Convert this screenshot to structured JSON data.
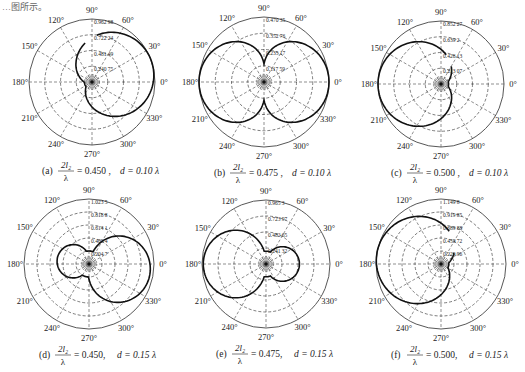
{
  "figure": {
    "header_fragment": "…图所示。",
    "colors": {
      "grid": "#444444",
      "curve": "#111111",
      "text": "#222222",
      "background": "#ffffff"
    }
  },
  "chart_data": [
    {
      "id": "a",
      "type": "polar",
      "label": "(a)",
      "caption": {
        "prefix": "(a)",
        "fraction_num": "2l₂",
        "fraction_den": "λ",
        "eq": "= 0.450 ,",
        "d": "d = 0.10 λ"
      },
      "center": [
        92,
        82
      ],
      "radius": 63,
      "ring_labels": [
        "0.240 75",
        "0.481 49",
        "0.722 24",
        "0.962 98"
      ],
      "rmax": 0.96298,
      "angle_labels": [
        "0°",
        "30°",
        "60°",
        "90°",
        "120°",
        "150°",
        "180°",
        "210°",
        "240°",
        "270°",
        "300°",
        "330°"
      ],
      "pattern": {
        "a": 0.55,
        "b": 0.45,
        "phi": 20,
        "cutout": [
          85,
          100
        ]
      }
    },
    {
      "id": "b",
      "type": "polar",
      "label": "(b)",
      "caption": {
        "prefix": "(b)",
        "fraction_num": "2l₂",
        "fraction_den": "λ",
        "eq": "= 0.475 ,",
        "d": "d = 0.10 λ"
      },
      "center": [
        264,
        82
      ],
      "radius": 65,
      "ring_labels": [
        "0.117 59",
        "0.235 17",
        "0.352 76",
        "0.470 35"
      ],
      "rmax": 0.47035,
      "angle_labels": [
        "0°",
        "30°",
        "60°",
        "90°",
        "120°",
        "150°",
        "180°",
        "210°",
        "240°",
        "270°",
        "300°",
        "330°"
      ],
      "pattern": {
        "type": "figure8"
      }
    },
    {
      "id": "c",
      "type": "polar",
      "label": "(c)",
      "caption": {
        "prefix": "(c)",
        "fraction_num": "2l₂",
        "fraction_den": "λ",
        "eq": "= 0.500 ,",
        "d": "d = 0.10 λ"
      },
      "center": [
        441,
        84
      ],
      "radius": 63,
      "ring_labels": [
        "0.213 07",
        "0.426 13",
        "0.639 2",
        "0.852 27"
      ],
      "rmax": 0.85227,
      "angle_labels": [
        "0°",
        "30°",
        "60°",
        "90°",
        "120°",
        "150°",
        "180°",
        "210°",
        "240°",
        "270°",
        "300°",
        "330°"
      ],
      "pattern": {
        "a": 0.55,
        "b": 0.45,
        "phi": 180,
        "cutout": [
          60,
          80
        ]
      }
    },
    {
      "id": "d",
      "type": "polar",
      "label": "(d)",
      "caption": {
        "prefix": "(d)",
        "fraction_num": "2l₂",
        "fraction_den": "λ",
        "eq": "= 0.450,",
        "d": "d = 0.15 λ"
      },
      "center": [
        89,
        264
      ],
      "radius": 65,
      "ring_labels": [
        "0.204 7",
        "0.409 4",
        "0.614 1",
        "0.818 8",
        "1.023 5"
      ],
      "rmax": 1.0235,
      "angle_labels": [
        "0°",
        "30°",
        "60°",
        "90°",
        "120°",
        "150°",
        "180°",
        "210°",
        "240°",
        "270°",
        "300°",
        "330°"
      ],
      "pattern": {
        "type": "twolobe",
        "main": 0.95,
        "back": 0.55,
        "phi": -10
      }
    },
    {
      "id": "e",
      "type": "polar",
      "label": "(e)",
      "caption": {
        "prefix": "(e)",
        "fraction_num": "2l₂",
        "fraction_den": "λ",
        "eq": "= 0.475,",
        "d": "d = 0.15 λ"
      },
      "center": [
        266,
        264
      ],
      "radius": 64,
      "ring_labels": [
        "0.241 32",
        "0.482 65",
        "0.723 97",
        "0.965 3"
      ],
      "rmax": 0.9653,
      "angle_labels": [
        "0°",
        "30°",
        "60°",
        "90°",
        "120°",
        "150°",
        "180°",
        "210°",
        "240°",
        "270°",
        "300°",
        "330°"
      ],
      "pattern": {
        "type": "twolobe",
        "main": 0.98,
        "back": 0.58,
        "phi": 180
      }
    },
    {
      "id": "f",
      "type": "polar",
      "label": "(f)",
      "caption": {
        "prefix": "(f)",
        "fraction_num": "2l₂",
        "fraction_den": "λ",
        "eq": "= 0.500,",
        "d": "d = 0.15 λ"
      },
      "center": [
        441,
        264
      ],
      "radius": 65,
      "ring_labels": [
        "0.229 96",
        "0.459 72",
        "0.689 88",
        "0.919 85",
        "1.149 8"
      ],
      "rmax": 1.1498,
      "angle_labels": [
        "0°",
        "30°",
        "60°",
        "90°",
        "120°",
        "150°",
        "180°",
        "210°",
        "240°",
        "270°",
        "300°",
        "330°"
      ],
      "pattern": {
        "a": 0.55,
        "b": 0.45,
        "phi": 170,
        "cutout": [
          40,
          75
        ]
      }
    }
  ]
}
